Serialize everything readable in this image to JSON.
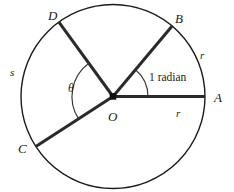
{
  "figure": {
    "background_color": "#ffffff",
    "stroke_color": "#1a1a1a",
    "circle_stroke_color": "#1a1a1a",
    "label_color": "#1a1a1a"
  },
  "chart_data": {
    "type": "diagram",
    "subtype": "circle-geometry",
    "title": "",
    "xlabel": "",
    "ylabel": "",
    "grid": false,
    "legend": null,
    "circle": {
      "center_label": "O",
      "center_x": 113,
      "center_y": 96.5,
      "radius": 92,
      "stroke_width": 1.4
    },
    "radii": [
      {
        "name": "OA",
        "endpoint_label": "A",
        "angle_deg": 0,
        "stroke_width": 3.0,
        "length_label": "r"
      },
      {
        "name": "OB",
        "endpoint_label": "B",
        "angle_deg": 50,
        "stroke_width": 3.0,
        "length_label": "r"
      },
      {
        "name": "OD",
        "endpoint_label": "D",
        "angle_deg": 126,
        "stroke_width": 3.0,
        "length_label": ""
      },
      {
        "name": "OC",
        "endpoint_label": "C",
        "angle_deg": 213,
        "stroke_width": 3.0,
        "length_label": ""
      }
    ],
    "angle_arcs": [
      {
        "name": "one-radian-arc",
        "label": "1 radian",
        "from_angle_deg": 0,
        "to_angle_deg": 50,
        "arc_radius": 35,
        "stroke_width": 1.2
      },
      {
        "name": "theta-arc",
        "label": "θ",
        "from_angle_deg": 126,
        "to_angle_deg": 213,
        "arc_radius": 41,
        "stroke_width": 1.2
      }
    ],
    "arc_length_label": "s"
  },
  "labels": {
    "point_a": "A",
    "point_b": "B",
    "point_c": "C",
    "point_d": "D",
    "point_o": "O",
    "radius_right": "r",
    "radius_upper_right": "r",
    "arc_s": "s",
    "angle_theta": "θ",
    "angle_one_radian": "1 radian"
  }
}
